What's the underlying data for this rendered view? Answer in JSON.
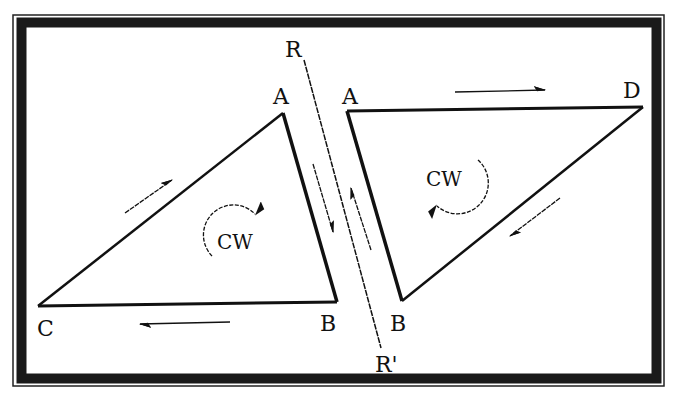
{
  "colors": {
    "background": "#ffffff",
    "ink": "#111111",
    "frame": "#1a1a1a"
  },
  "frame": {
    "outer": {
      "x": 13,
      "y": 15,
      "w": 651,
      "h": 371
    },
    "band_width": 10
  },
  "line_rr": {
    "start_label": "R",
    "end_label": "R'",
    "x1": 304,
    "y1": 60,
    "x2": 381,
    "y2": 348
  },
  "left_triangle": {
    "vertices": {
      "A": {
        "label": "A",
        "x": 283,
        "y": 113,
        "lx": 282,
        "ly": 103
      },
      "B": {
        "label": "B",
        "x": 337,
        "y": 302,
        "lx": 330,
        "ly": 331
      },
      "C": {
        "label": "C",
        "x": 38,
        "y": 306,
        "lx": 44,
        "ly": 336
      }
    },
    "rotation_label": "CW",
    "rotation_label_pos": {
      "x": 240,
      "y": 249
    }
  },
  "right_triangle": {
    "vertices": {
      "A": {
        "label": "A",
        "x": 347,
        "y": 111,
        "lx": 352,
        "ly": 103
      },
      "D": {
        "label": "D",
        "x": 643,
        "y": 107,
        "lx": 632,
        "ly": 97
      },
      "B": {
        "label": "B",
        "x": 402,
        "y": 301,
        "lx": 402,
        "ly": 331
      }
    },
    "rotation_label": "CW",
    "rotation_label_pos": {
      "x": 447,
      "y": 186
    }
  },
  "arrows": [
    {
      "name": "arrow-along-cb-left",
      "x1": 230,
      "y1": 322,
      "x2": 140,
      "y2": 324,
      "direction": "left"
    },
    {
      "name": "arrow-along-ca-up",
      "x1": 125,
      "y1": 213,
      "x2": 172,
      "y2": 180,
      "direction": "up-right"
    },
    {
      "name": "arrow-along-ad-right",
      "x1": 455,
      "y1": 92,
      "x2": 545,
      "y2": 90,
      "direction": "right"
    },
    {
      "name": "arrow-along-db-down",
      "x1": 560,
      "y1": 198,
      "x2": 510,
      "y2": 236,
      "direction": "down-left"
    },
    {
      "name": "arrow-fault-left-down",
      "x1": 313,
      "y1": 164,
      "x2": 332,
      "y2": 230,
      "direction": "down"
    },
    {
      "name": "arrow-fault-right-up",
      "x1": 371,
      "y1": 250,
      "x2": 352,
      "y2": 188,
      "direction": "up"
    }
  ]
}
